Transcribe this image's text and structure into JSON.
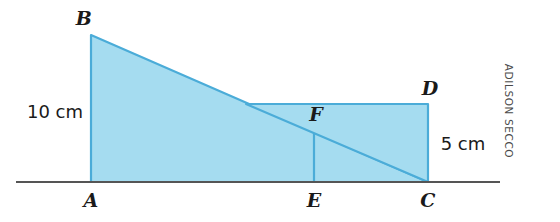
{
  "figure": {
    "type": "geometry-diagram",
    "width": 560,
    "height": 222,
    "colors": {
      "fill": "#a5dcf0",
      "stroke": "#4bacd8",
      "baseline": "#555555",
      "text": "#1a1a1a",
      "credit": "#4a4a4a",
      "background": "#ffffff"
    },
    "baseline": {
      "name": "ground-line",
      "x1": 16,
      "x2": 500,
      "y": 182
    },
    "points": [
      {
        "id": "A",
        "label": "A",
        "x": 91,
        "y": 182,
        "label_x": 91,
        "label_y": 200
      },
      {
        "id": "B",
        "label": "B",
        "x": 91,
        "y": 35,
        "label_x": 84,
        "label_y": 18
      },
      {
        "id": "C",
        "label": "C",
        "x": 428,
        "y": 182,
        "label_x": 428,
        "label_y": 200
      },
      {
        "id": "D",
        "label": "D",
        "x": 428,
        "y": 104,
        "label_x": 430,
        "label_y": 88
      },
      {
        "id": "E",
        "label": "E",
        "x": 314,
        "y": 182,
        "label_x": 314,
        "label_y": 200
      },
      {
        "id": "F",
        "label": "F",
        "x": 314,
        "y": 133,
        "label_x": 316,
        "label_y": 114
      }
    ],
    "shapes": [
      {
        "name": "triangle-abc",
        "vertices": "A,B,C",
        "path": "M 91,35 L 428,182 L 91,182 Z"
      },
      {
        "name": "triangle-dec",
        "vertices": "D,E,C",
        "path": "M 428,104 L 428,182 L 246,104 Z"
      }
    ],
    "segments": [
      {
        "name": "segment-fe",
        "x1": 314,
        "y1": 133,
        "x2": 314,
        "y2": 182
      }
    ],
    "measures": [
      {
        "id": "ab",
        "text": "10 cm",
        "x": 55,
        "y": 112,
        "describes": "height AB"
      },
      {
        "id": "cd",
        "text": "5 cm",
        "x": 463,
        "y": 144,
        "describes": "height CD"
      }
    ],
    "credit": "ADILSON SECCO"
  }
}
